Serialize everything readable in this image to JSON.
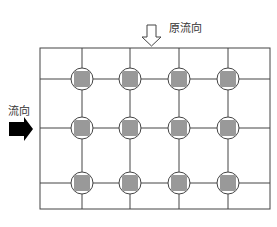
{
  "labels": {
    "original_flow": "原流向",
    "flow": "流向"
  },
  "grid": {
    "left": 40,
    "top": 48,
    "right": 270,
    "bottom": 209,
    "columns_x": [
      82,
      130,
      179,
      228
    ],
    "rows_y": [
      79,
      128,
      183
    ]
  },
  "colors": {
    "line": "#444444",
    "node_fill": "#999999",
    "arrow_fill": "#000000"
  }
}
